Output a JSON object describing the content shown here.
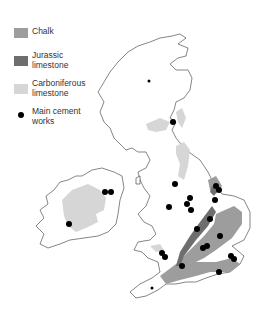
{
  "legend": {
    "items": [
      {
        "label_line1": "Chalk",
        "label_line2": "",
        "color": "#9d9d9d",
        "kind": "swatch"
      },
      {
        "label_line1": "Jurassic",
        "label_line2": "limestone",
        "color": "#6e6e6e",
        "kind": "swatch"
      },
      {
        "label_line1": "Carboniferous",
        "label_line2": "limestone",
        "color": "#d6d6d6",
        "kind": "swatch"
      },
      {
        "label_line1": "Main cement",
        "label_line2": "works",
        "color": "#000000",
        "kind": "dot"
      }
    ]
  },
  "colors": {
    "chalk": "#9d9d9d",
    "jurassic": "#6e6e6e",
    "carboniferous": "#d6d6d6",
    "cement_works": "#000000"
  }
}
